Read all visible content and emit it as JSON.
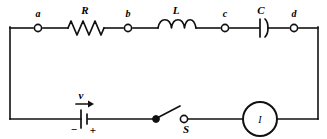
{
  "figure": {
    "kind": "series-rlc-circuit-schematic",
    "background_color": "#ffffff",
    "line_color": "#111111"
  },
  "nodes": [
    {
      "id": "a",
      "label": "a",
      "x": 38,
      "y": 28
    },
    {
      "id": "b",
      "label": "b",
      "x": 128,
      "y": 28
    },
    {
      "id": "c",
      "label": "c",
      "x": 225,
      "y": 28
    },
    {
      "id": "d",
      "label": "d",
      "x": 294,
      "y": 28
    }
  ],
  "components": [
    {
      "id": "resistor",
      "symbol": "resistor-zigzag",
      "label": "R",
      "label_x": 85,
      "label_y": 14
    },
    {
      "id": "inductor",
      "symbol": "inductor-coil",
      "label": "L",
      "label_x": 176,
      "label_y": 14
    },
    {
      "id": "capacitor",
      "symbol": "capacitor-polarized",
      "label": "C",
      "label_x": 261,
      "label_y": 14
    },
    {
      "id": "source",
      "symbol": "battery-cell",
      "label": "v",
      "label_x": 81,
      "label_y": 99
    },
    {
      "id": "switch",
      "symbol": "switch-spst-open",
      "label": "S",
      "label_x": 186,
      "label_y": 133
    },
    {
      "id": "ammeter",
      "symbol": "meter-circle",
      "label": "I",
      "label_x": 260,
      "label_y": 121
    }
  ],
  "source": {
    "voltage_label": "v",
    "minus_sign": "−",
    "plus_sign": "+",
    "arrow_direction": "right"
  },
  "ammeter": {
    "current_label": "I"
  },
  "switch": {
    "name_label": "S",
    "state": "open"
  }
}
